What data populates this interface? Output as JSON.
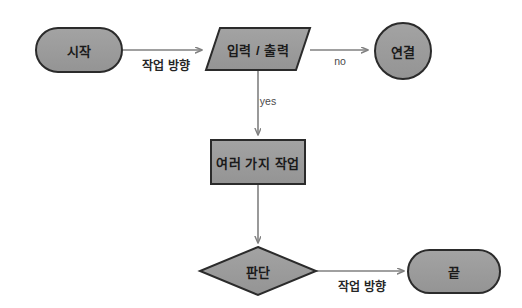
{
  "diagram": {
    "colors": {
      "node_fill": "#9b9b9b",
      "node_stroke": "#2b2b2b",
      "connector": "#808080",
      "text": "#1a1a1a",
      "background": "#ffffff"
    },
    "nodes": [
      {
        "id": "start",
        "shape": "stadium",
        "label": "시작",
        "cx": 79,
        "cy": 50,
        "w": 86,
        "h": 44
      },
      {
        "id": "io",
        "shape": "parallelogram",
        "label": "입력 / 출력",
        "cx": 258,
        "cy": 49,
        "w": 104,
        "h": 42
      },
      {
        "id": "connector",
        "shape": "circle",
        "label": "연결",
        "cx": 403,
        "cy": 51,
        "w": 56,
        "h": 56
      },
      {
        "id": "process",
        "shape": "rectangle",
        "label": "여러 가지 작업",
        "cx": 258,
        "cy": 162,
        "w": 94,
        "h": 44
      },
      {
        "id": "decision",
        "shape": "diamond",
        "label": "판단",
        "cx": 258,
        "cy": 271,
        "w": 116,
        "h": 48
      },
      {
        "id": "end",
        "shape": "stadium",
        "label": "끝",
        "cx": 454,
        "cy": 271,
        "w": 92,
        "h": 43
      }
    ],
    "edges": [
      {
        "id": "start-to-io",
        "from": "start",
        "to": "io",
        "label": "작업 방향",
        "label_x": 166,
        "label_y": 64,
        "label_style": "bold"
      },
      {
        "id": "io-to-connector",
        "from": "io",
        "to": "connector",
        "label": "no",
        "label_x": 340,
        "label_y": 61,
        "label_style": "small"
      },
      {
        "id": "io-to-process",
        "from": "io",
        "to": "process",
        "label": "yes",
        "label_x": 268,
        "label_y": 101,
        "label_style": "small"
      },
      {
        "id": "process-to-decision",
        "from": "process",
        "to": "decision",
        "label": "",
        "label_x": 0,
        "label_y": 0,
        "label_style": "none"
      },
      {
        "id": "decision-to-end",
        "from": "decision",
        "to": "end",
        "label": "작업 방향",
        "label_x": 362,
        "label_y": 285,
        "label_style": "bold"
      }
    ]
  }
}
